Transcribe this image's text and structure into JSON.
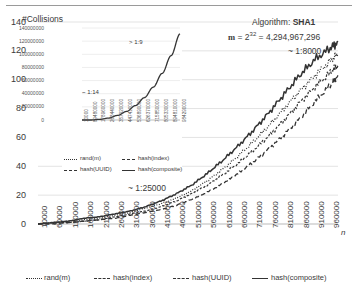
{
  "chart_data": {
    "type": "line",
    "title": "",
    "xlabel": "n",
    "ylabel": "#Collisions",
    "xlim": [
      10000,
      985000
    ],
    "ylim": [
      0,
      140
    ],
    "grid": true,
    "legend_position": "bottom",
    "categories": [
      10000,
      60000,
      110000,
      160000,
      210000,
      260000,
      310000,
      360000,
      410000,
      460000,
      510000,
      560000,
      610000,
      660000,
      710000,
      760000,
      810000,
      860000,
      910000,
      960000
    ],
    "xticks": [
      "10000",
      "60000",
      "110000",
      "160000",
      "210000",
      "260000",
      "310000",
      "360000",
      "410000",
      "460000",
      "510000",
      "560000",
      "610000",
      "660000",
      "710000",
      "760000",
      "810000",
      "860000",
      "910000",
      "960000"
    ],
    "yticks": [
      "0",
      "20",
      "40",
      "60",
      "80",
      "100",
      "120",
      "140"
    ],
    "series": [
      {
        "name": "rand(m)",
        "style": "dotted",
        "x": [
          10000,
          60000,
          110000,
          160000,
          210000,
          260000,
          310000,
          360000,
          410000,
          460000,
          510000,
          560000,
          610000,
          660000,
          710000,
          760000,
          810000,
          860000,
          910000,
          960000,
          985000
        ],
        "values": [
          0,
          1,
          2,
          3,
          4,
          6,
          8,
          11,
          14,
          18,
          23,
          30,
          38,
          47,
          57,
          68,
          80,
          92,
          103,
          113,
          118
        ]
      },
      {
        "name": "hash(index)",
        "style": "dashed-short",
        "x": [
          10000,
          60000,
          110000,
          160000,
          210000,
          260000,
          310000,
          360000,
          410000,
          460000,
          510000,
          560000,
          610000,
          660000,
          710000,
          760000,
          810000,
          860000,
          910000,
          960000,
          985000
        ],
        "values": [
          0,
          1,
          1,
          2,
          3,
          5,
          7,
          9,
          12,
          16,
          21,
          27,
          34,
          42,
          51,
          61,
          72,
          84,
          95,
          105,
          110
        ]
      },
      {
        "name": "hash(UUID)",
        "style": "dashed-long",
        "x": [
          10000,
          60000,
          110000,
          160000,
          210000,
          260000,
          310000,
          360000,
          410000,
          460000,
          510000,
          560000,
          610000,
          660000,
          710000,
          760000,
          810000,
          860000,
          910000,
          960000,
          985000
        ],
        "values": [
          0,
          0,
          1,
          2,
          3,
          4,
          6,
          8,
          10,
          13,
          17,
          22,
          28,
          35,
          43,
          52,
          62,
          73,
          85,
          96,
          103
        ]
      },
      {
        "name": "hash(composite)",
        "style": "solid",
        "x": [
          10000,
          60000,
          110000,
          160000,
          210000,
          260000,
          310000,
          360000,
          410000,
          460000,
          510000,
          560000,
          610000,
          660000,
          710000,
          760000,
          810000,
          860000,
          910000,
          960000,
          985000
        ],
        "values": [
          0,
          1,
          2,
          4,
          5,
          7,
          9,
          12,
          16,
          21,
          27,
          35,
          44,
          54,
          65,
          77,
          90,
          103,
          114,
          122,
          126
        ]
      }
    ],
    "annotations": [
      {
        "id": "algorithm",
        "text": "Algorithm: SHA1"
      },
      {
        "id": "m_value",
        "text": "= 4,294,967,296"
      },
      {
        "id": "ratio_8000",
        "text": "~ 1:8000"
      },
      {
        "id": "ratio_25000",
        "text": "~ 1:25000"
      }
    ]
  },
  "inset_chart": {
    "type": "line",
    "xlabel": "",
    "ylabel": "",
    "ylim": [
      0,
      140000000
    ],
    "grid": true,
    "yticks": [
      "140000000",
      "120000000",
      "100000000",
      "80000000",
      "60000000",
      "40000000",
      "20000000",
      "0"
    ],
    "xticks": [
      "10000",
      "89480000",
      "178960000",
      "268440000",
      "357920000",
      "447410000",
      "536890000",
      "626370000",
      "715850000",
      "805330000",
      "894810000",
      "984290000"
    ],
    "series": [
      {
        "name": "collisions",
        "style": "solid",
        "values": [
          0,
          0,
          1000000,
          3000000,
          7000000,
          13000000,
          22000000,
          34000000,
          50000000,
          71000000,
          98000000,
          131000000
        ]
      }
    ],
    "annotations": [
      {
        "id": "ratio_9",
        "text": "> 1:9"
      },
      {
        "id": "ratio_14",
        "text": "~ 1:14"
      }
    ],
    "legend": [
      "rand(m)",
      "hash(index)",
      "hash(UUID)",
      "hash(composite)"
    ]
  },
  "labels": {
    "y_axis_title": "#Collisions",
    "x_axis_title": "n",
    "algorithm_prefix": "Algorithm:",
    "algorithm_name": "SHA1",
    "m_symbol": "m",
    "m_equals": "=",
    "m_power_base": "2",
    "m_power_exp": "32",
    "m_result": "= 4,294,967,296",
    "ratio_8000": "~ 1:8000",
    "ratio_25000": "~ 1:25000",
    "ratio_9": "> 1:9",
    "ratio_14": "~ 1:14"
  },
  "legend": {
    "items": [
      {
        "label": "rand(m)",
        "style": "dotted"
      },
      {
        "label": "hash(index)",
        "style": "dashed-short"
      },
      {
        "label": "hash(UUID)",
        "style": "dashed-long"
      },
      {
        "label": "hash(composite)",
        "style": "solid"
      }
    ]
  },
  "colors": {
    "line": "#333333",
    "grid": "#e3e3e3",
    "text": "#3a3a3a",
    "background": "#ffffff"
  }
}
